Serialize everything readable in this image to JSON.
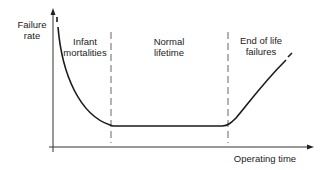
{
  "diagram": {
    "y_axis_label_line1": "Failure",
    "y_axis_label_line2": "rate",
    "x_axis_label": "Operating time",
    "regions": [
      {
        "line1": "Infant",
        "line2": "mortalities"
      },
      {
        "line1": "Normal",
        "line2": "lifetime"
      },
      {
        "line1": "End of life",
        "line2": "failures"
      }
    ],
    "colors": {
      "line": "#222222",
      "background": "#ffffff"
    }
  }
}
